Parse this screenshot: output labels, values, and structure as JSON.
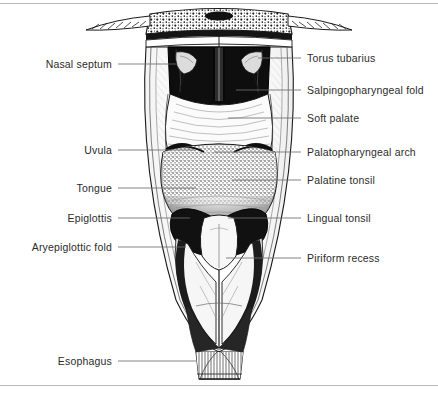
{
  "figure": {
    "type": "anatomical-line-illustration",
    "style": "black-and-white stipple and hatch engraving",
    "colors": {
      "ink": "#1a1a1a",
      "paper": "#ffffff",
      "leader_line": "#6e6e6e",
      "rule": "#b8b8b8",
      "label_text": "#2b2b2b"
    },
    "rules": [
      {
        "name": "top-rule",
        "y": 3
      },
      {
        "name": "bottom-rule",
        "y": 385
      }
    ]
  },
  "labels": {
    "left": [
      {
        "id": "nasal-septum",
        "text": "Nasal septum",
        "y": 64,
        "text_end_x": 112,
        "leader_end_x": 176
      },
      {
        "id": "uvula",
        "text": "Uvula",
        "y": 150,
        "text_end_x": 112,
        "leader_end_x": 196
      },
      {
        "id": "tongue",
        "text": "Tongue",
        "y": 188,
        "text_end_x": 112,
        "leader_end_x": 196
      },
      {
        "id": "epiglottis",
        "text": "Epiglottis",
        "y": 218,
        "text_end_x": 112,
        "leader_end_x": 190
      },
      {
        "id": "aryepiglottic-fold",
        "text": "Aryepiglottic fold",
        "y": 247,
        "text_end_x": 112,
        "leader_end_x": 186
      },
      {
        "id": "esophagus",
        "text": "Esophagus",
        "y": 361,
        "text_end_x": 112,
        "leader_end_x": 196
      }
    ],
    "right": [
      {
        "id": "torus-tubarius",
        "text": "Torus tubarius",
        "y": 58,
        "text_start_x": 307,
        "leader_start_x": 258
      },
      {
        "id": "salpingopharyngeal-fold",
        "text": "Salpingopharyngeal fold",
        "y": 90,
        "text_start_x": 307,
        "leader_start_x": 236
      },
      {
        "id": "soft-palate",
        "text": "Soft palate",
        "y": 118,
        "text_start_x": 307,
        "leader_start_x": 228
      },
      {
        "id": "palatopharyngeal-arch",
        "text": "Palatopharyngeal arch",
        "y": 152,
        "text_start_x": 307,
        "leader_start_x": 214
      },
      {
        "id": "palatine-tonsil",
        "text": "Palatine tonsil",
        "y": 180,
        "text_start_x": 307,
        "leader_start_x": 232
      },
      {
        "id": "lingual-tonsil",
        "text": "Lingual tonsil",
        "y": 218,
        "text_start_x": 307,
        "leader_start_x": 228
      },
      {
        "id": "piriform-recess",
        "text": "Piriform recess",
        "y": 258,
        "text_start_x": 307,
        "leader_start_x": 226
      }
    ]
  },
  "structures": [
    {
      "id": "skull-base",
      "name": "stippled skull base with lateral wings"
    },
    {
      "id": "nasopharynx",
      "name": "dark nasopharyngeal cavity"
    },
    {
      "id": "nasal-septum",
      "name": "vomer / nasal septum midline ridge"
    },
    {
      "id": "torus-tubarius",
      "name": "paired eustachian tube elevations"
    },
    {
      "id": "soft-palate",
      "name": "soft palate velum"
    },
    {
      "id": "uvula",
      "name": "uvula midline pendant"
    },
    {
      "id": "palatine-tonsil",
      "name": "paired palatine tonsils"
    },
    {
      "id": "tongue-base",
      "name": "tongue base with lingual tonsil stipple"
    },
    {
      "id": "epiglottis",
      "name": "epiglottis leaf"
    },
    {
      "id": "laryngeal-inlet",
      "name": "laryngeal aditus"
    },
    {
      "id": "piriform-recess",
      "name": "paired piriform recesses"
    },
    {
      "id": "pharyngeal-wall",
      "name": "opened posterior pharyngeal wall"
    },
    {
      "id": "esophagus",
      "name": "esophageal inlet with longitudinal folds"
    }
  ]
}
